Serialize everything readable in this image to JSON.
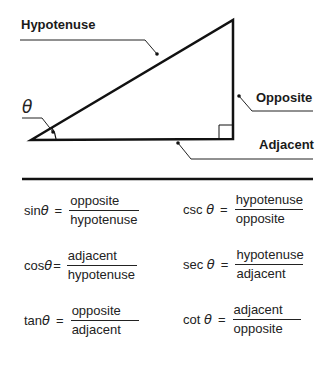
{
  "diagram": {
    "labels": {
      "hypotenuse": "Hypotenuse",
      "opposite": "Opposite",
      "adjacent": "Adjacent",
      "angle": "θ"
    },
    "triangle": {
      "vertices": {
        "angle_vertex": [
          31,
          140
        ],
        "top": [
          233,
          20
        ],
        "right_angle": [
          233,
          139
        ]
      },
      "right_angle_marker": true,
      "angle_arc": true
    }
  },
  "formulas": {
    "sin": {
      "fn": "sin",
      "var": "θ",
      "eq": "=",
      "num": "opposite",
      "den": "hypotenuse"
    },
    "cos": {
      "fn": "cos",
      "var": "θ",
      "eq": "=",
      "num": "adjacent",
      "den": "hypotenuse"
    },
    "tan": {
      "fn": "tan",
      "var": "θ",
      "eq": "=",
      "num": "opposite",
      "den": "adjacent"
    },
    "csc": {
      "fn": "csc ",
      "var": "θ",
      "eq": "=",
      "num": "hypotenuse",
      "den": "opposite"
    },
    "sec": {
      "fn": "sec ",
      "var": "θ",
      "eq": "=",
      "num": "hypotenuse",
      "den": "adjacent"
    },
    "cot": {
      "fn": "cot ",
      "var": "θ",
      "eq": "=",
      "num": "adjacent",
      "den": "opposite"
    }
  }
}
